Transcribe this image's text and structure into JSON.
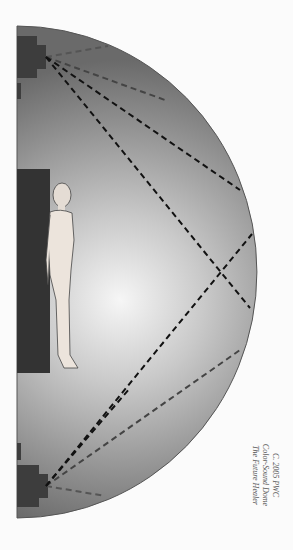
{
  "diagram": {
    "title": "Color-Sound Dome",
    "caption": {
      "line1": "C. 2005 PWC",
      "line2": "Color-Sound Dome",
      "line3": "The Future Healer"
    },
    "elements": {
      "dome": "semicircular dome cross-section",
      "figure": "standing human figure",
      "table": "dark platform behind figure",
      "speakers": [
        "top speaker",
        "bottom speaker"
      ],
      "sound_paths": "dashed lines radiating from speakers and reflecting off dome"
    },
    "colors": {
      "background": "#fbfbfb",
      "dome_edge": "#5a5a5a",
      "dome_center": "#f4f4f4",
      "dark_block": "#3a3a3a",
      "dashed_line": "#111111"
    }
  }
}
